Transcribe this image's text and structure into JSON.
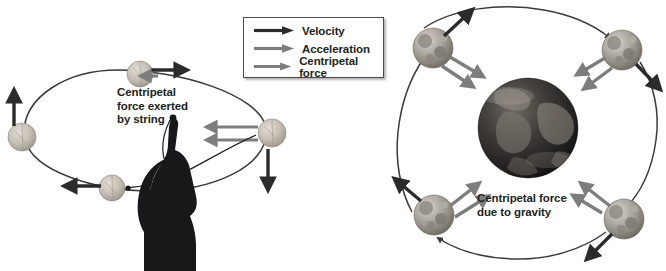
{
  "figure": {
    "background": "#ffffff"
  },
  "legend": {
    "name": "legend-box",
    "border_color": "#4a4a4a",
    "items": [
      {
        "label": "Velocity",
        "icon": "arrow-right-icon",
        "color": "#2b2b2b"
      },
      {
        "label": "Acceleration",
        "icon": "arrow-right-icon",
        "color": "#7d7d7d"
      },
      {
        "label": "Centripetal force",
        "icon": "arrow-right-icon",
        "color": "#7d7d7d"
      }
    ]
  },
  "left_panel": {
    "name": "ball-on-string-diagram",
    "caption": "Centripetal\nforce exerted\nby string",
    "caption_lines": [
      "Centripetal",
      "force exerted",
      "by string"
    ],
    "orbit_shape": "ellipse",
    "orbit_color": "#3a3a3a",
    "person": {
      "name": "person-silhouette",
      "color": "#1c1c1c"
    },
    "balls": [
      {
        "position": "top",
        "velocity_direction": "right",
        "force_direction": "left"
      },
      {
        "position": "right",
        "velocity_direction": "down",
        "force_direction": "left"
      },
      {
        "position": "bottom",
        "velocity_direction": "left",
        "force_direction": "right"
      },
      {
        "position": "left",
        "velocity_direction": "up",
        "force_direction": "right"
      }
    ]
  },
  "right_panel": {
    "name": "moon-orbit-diagram",
    "caption": "Centripetal force\ndue to gravity",
    "caption_lines": [
      "Centripetal force",
      "due to gravity"
    ],
    "orbit_shape": "circle",
    "orbit_color": "#3a3a3a",
    "central_body": {
      "name": "earth-sphere",
      "label": "Earth"
    },
    "moons": [
      {
        "position": "top-left",
        "velocity_direction": "up-right",
        "force_direction": "down-right"
      },
      {
        "position": "top-right",
        "velocity_direction": "down-right",
        "force_direction": "down-left"
      },
      {
        "position": "bottom-right",
        "velocity_direction": "down-left",
        "force_direction": "up-left"
      },
      {
        "position": "bottom-left",
        "velocity_direction": "up-left",
        "force_direction": "up-right"
      }
    ]
  },
  "colors": {
    "velocity": "#2b2b2b",
    "force": "#7d7d7d",
    "orbit": "#3a3a3a",
    "text": "#231f20"
  }
}
